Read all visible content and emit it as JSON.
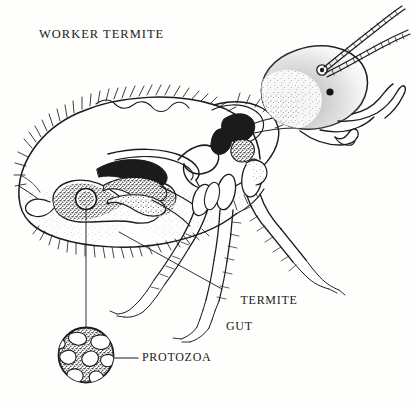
{
  "figure": {
    "domain": "scientific-illustration",
    "style": "pen-and-ink stipple line drawing, black on white",
    "background_color": "#fefefd",
    "ink_color": "#1b1b1b",
    "width": 413,
    "height": 411
  },
  "labels": {
    "title": "WORKER TERMITE",
    "gut_line1": "TERMITE",
    "gut_line2": "GUT",
    "protozoa": "PROTOZOA"
  },
  "callouts": [
    {
      "name": "termite-gut",
      "text": "TERMITE GUT",
      "leader_from": [
        222,
        289
      ],
      "leader_to": [
        119,
        232
      ],
      "leader_style": "straight thin diagonal"
    },
    {
      "name": "protozoa",
      "text": "PROTOZOA",
      "leader_from": [
        138,
        358
      ],
      "leader_to": [
        116,
        358
      ],
      "leader_style": "short horizontal dash"
    },
    {
      "name": "protozoa-magnification",
      "text": "",
      "leader_from": [
        86,
        206
      ],
      "leader_to": [
        86,
        327
      ],
      "leader_style": "vertical magnification line from gut to inset circle"
    }
  ],
  "anatomy_parts": [
    {
      "name": "abdomen",
      "description": "large bristled oval abdomen at left"
    },
    {
      "name": "thorax",
      "description": "segmented mid-body with leg attachments"
    },
    {
      "name": "head",
      "description": "rounded stippled head capsule at right"
    },
    {
      "name": "eye",
      "description": "small solid black eye spot"
    },
    {
      "name": "mandibles",
      "description": "forward projecting jaws"
    },
    {
      "name": "antenna-upper",
      "description": "long beaded antenna sweeping up-right"
    },
    {
      "name": "antenna-lower",
      "description": "shorter beaded antenna below the first"
    },
    {
      "name": "foregut-crop",
      "description": "dark solid foregut region in thorax"
    },
    {
      "name": "midgut-loop",
      "description": "coiled looping midgut in abdomen"
    },
    {
      "name": "hindgut-paunch",
      "description": "large stippled hindgut paunch"
    },
    {
      "name": "protozoa-source-circle",
      "description": "small circle in paunch marking magnified protozoan"
    },
    {
      "name": "legs",
      "description": "three pairs of segmented spiny legs with tarsal claws"
    }
  ],
  "protozoa_inset": {
    "shape": "circle",
    "center": [
      86,
      355
    ],
    "radius": 28,
    "fill": "dense stipple",
    "features": "irregular white vacuole shapes inside"
  }
}
